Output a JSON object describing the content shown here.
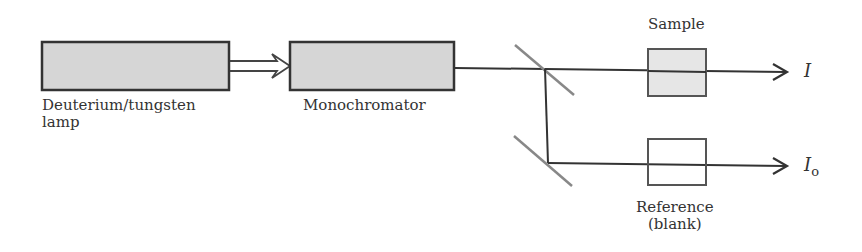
{
  "components": {
    "lamp": {
      "label_line1": "Deuterium/tungsten",
      "label_line2": "lamp"
    },
    "monochromator": {
      "label": "Monochromator"
    },
    "sample": {
      "label": "Sample"
    },
    "reference": {
      "label_line1": "Reference",
      "label_line2": "(blank)"
    }
  },
  "outputs": {
    "sample_beam": {
      "symbol": "I"
    },
    "reference_beam": {
      "symbol": "I",
      "subscript": "o"
    }
  },
  "colors": {
    "box_fill": "#d6d6d6",
    "line": "#333333",
    "mirror": "#888888",
    "sample_fill": "#e6e6e6"
  }
}
